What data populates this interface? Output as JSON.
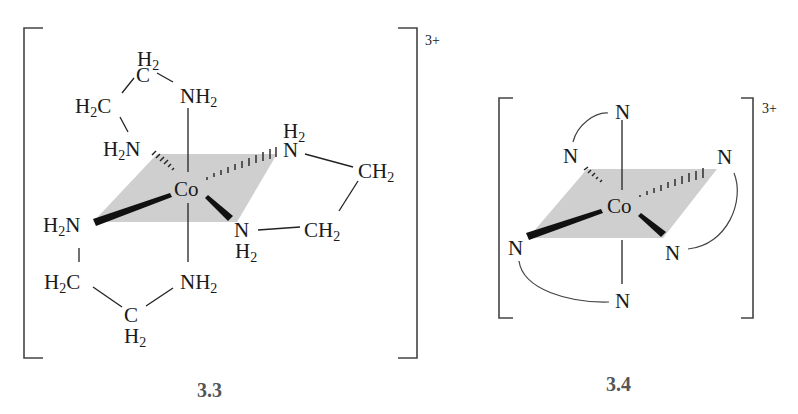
{
  "figure": {
    "colors": {
      "plane": "#cfcfcf",
      "ink": "#1a1a1a",
      "bracket": "#444444",
      "label": "#555555"
    }
  },
  "structures": [
    {
      "id": "3.3",
      "label": "3.3",
      "charge": "3+",
      "metal": "Co",
      "atoms": {
        "top_c": {
          "main": "C",
          "h": "H",
          "sub": "2"
        },
        "top_left_c": {
          "main": "H",
          "sub": "2",
          "tail": "C"
        },
        "top_nh2": {
          "main": "NH",
          "sub": "2"
        },
        "upper_left_n": {
          "main": "H",
          "sub": "2",
          "tail": "N"
        },
        "upper_right_n": {
          "main": "N",
          "h": "H",
          "sub": "2"
        },
        "right_upper_ch2": {
          "main": "CH",
          "sub": "2"
        },
        "left_n": {
          "main": "H",
          "sub": "2",
          "tail": "N"
        },
        "lower_right_n": {
          "main": "N",
          "h": "H",
          "sub": "2"
        },
        "right_lower_ch2": {
          "main": "CH",
          "sub": "2"
        },
        "bottom_left_c": {
          "main": "H",
          "sub": "2",
          "tail": "C"
        },
        "bottom_nh2": {
          "main": "NH",
          "sub": "2"
        },
        "bottom_c": {
          "main": "C",
          "h": "H",
          "sub": "2"
        }
      }
    },
    {
      "id": "3.4",
      "label": "3.4",
      "charge": "3+",
      "metal": "Co",
      "atoms": {
        "top": "N",
        "upper_left": "N",
        "upper_right": "N",
        "lower_left": "N",
        "lower_right": "N",
        "bottom": "N"
      }
    }
  ]
}
